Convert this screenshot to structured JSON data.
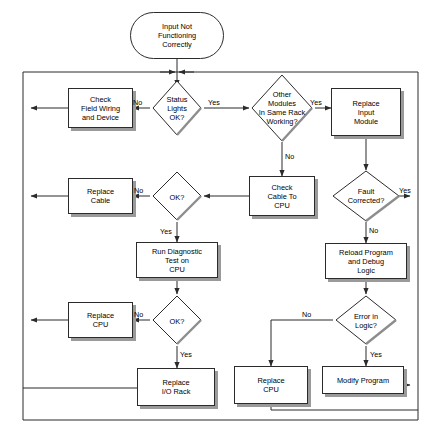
{
  "diagram": {
    "type": "flowchart",
    "line_color": "#2b2b2b",
    "shadow_color": "#9a9a9a",
    "background": "#ffffff"
  },
  "nodes": {
    "start": {
      "id": "start",
      "shape": "terminal",
      "text": "Input Not\nFunctioning\nCorrectly",
      "line1": "Input Not",
      "line2": "Functioning",
      "line3": "Correctly"
    },
    "check_field_wiring": {
      "id": "check_field_wiring",
      "shape": "process",
      "line1": "Check",
      "line2": "Field Wiring",
      "line3": "and Device"
    },
    "status_lights": {
      "id": "status_lights",
      "shape": "decision",
      "line1": "Status",
      "line2": "Lights",
      "line3": "OK?"
    },
    "other_modules": {
      "id": "other_modules",
      "shape": "decision",
      "line1": "Other",
      "line2": "Modules",
      "line3": "In Same Rack",
      "line4": "Working?"
    },
    "replace_input_module": {
      "id": "replace_input_module",
      "shape": "process",
      "line1": "Replace",
      "line2": "Input",
      "line3": "Module"
    },
    "check_cable_cpu": {
      "id": "check_cable_cpu",
      "shape": "process",
      "line1": "Check",
      "line2": "Cable To",
      "line3": "CPU"
    },
    "fault_corrected": {
      "id": "fault_corrected",
      "shape": "decision",
      "line1": "Fault",
      "line2": "Corrected?"
    },
    "replace_cable": {
      "id": "replace_cable",
      "shape": "process",
      "line1": "Replace",
      "line2": "Cable"
    },
    "ok_1": {
      "id": "ok_1",
      "shape": "decision",
      "line1": "OK?"
    },
    "run_diagnostic": {
      "id": "run_diagnostic",
      "shape": "process",
      "line1": "Run Diagnostic",
      "line2": "Test on",
      "line3": "CPU"
    },
    "reload_program": {
      "id": "reload_program",
      "shape": "process",
      "line1": "Reload Program",
      "line2": "and Debug",
      "line3": "Logic"
    },
    "replace_cpu_left": {
      "id": "replace_cpu_left",
      "shape": "process",
      "line1": "Replace",
      "line2": "CPU"
    },
    "ok_2": {
      "id": "ok_2",
      "shape": "decision",
      "line1": "OK?"
    },
    "error_in_logic": {
      "id": "error_in_logic",
      "shape": "decision",
      "line1": "Error in",
      "line2": "Logic?"
    },
    "replace_io_rack": {
      "id": "replace_io_rack",
      "shape": "process",
      "line1": "Replace",
      "line2": "I/O Rack"
    },
    "replace_cpu_bottom": {
      "id": "replace_cpu_bottom",
      "shape": "process",
      "line1": "Replace",
      "line2": "CPU"
    },
    "modify_program": {
      "id": "modify_program",
      "shape": "process",
      "line1": "Modify Program"
    }
  },
  "edge_labels": {
    "status_no": "No",
    "status_yes": "Yes",
    "modules_yes": "Yes",
    "modules_no": "No",
    "fault_yes": "Yes",
    "fault_no": "No",
    "ok1_no": "No",
    "ok1_yes": "Yes",
    "ok2_no": "No",
    "ok2_yes": "Yes",
    "logic_no": "No",
    "logic_yes": "Yes"
  }
}
